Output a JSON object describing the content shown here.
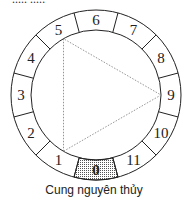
{
  "top_text_partial": "..... ....:",
  "diagram": {
    "center": [
      96,
      95
    ],
    "outer_radius": 85,
    "inner_radius": 65,
    "segments": 12,
    "labels": [
      "0",
      "1",
      "2",
      "3",
      "4",
      "5",
      "6",
      "7",
      "8",
      "9",
      "10",
      "11"
    ],
    "highlighted_segment": "0",
    "triangle_vertices": [
      "1",
      "5",
      "9"
    ],
    "colors": {
      "stroke": "#222222",
      "highlight_fill": "#d9d9d9",
      "triangle_stroke": "#888888"
    }
  },
  "caption": "Cung nguyên thủy"
}
